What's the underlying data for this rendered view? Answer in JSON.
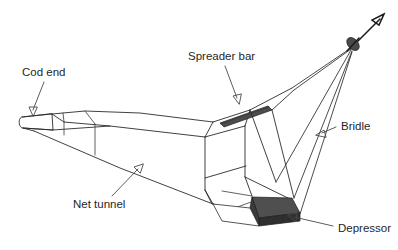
{
  "figure": {
    "type": "technical-line-diagram",
    "background_color": "#ffffff",
    "line_color": "#2b2b2b",
    "dark_fill_color": "#3f3f3f",
    "depressor_fill_color": "#4a4a4a",
    "spreader_fill_color": "#4d4d4d"
  },
  "labels": {
    "cod_end": "Cod end",
    "spreader_bar": "Spreader bar",
    "net_tunnel": "Net tunnel",
    "bridle": "Bridle",
    "depressor": "Depressor"
  },
  "parts": [
    {
      "id": "cod-end",
      "name": "Cod end",
      "description": "Rounded closed tube at the rear (left) end of the net"
    },
    {
      "id": "net-tunnel",
      "name": "Net tunnel",
      "description": "Long tapering panelled body joining cod end to net mouth"
    },
    {
      "id": "spreader-bar",
      "name": "Spreader bar",
      "description": "Dark rigid bar across the top of the net mouth"
    },
    {
      "id": "bridle",
      "name": "Bridle",
      "description": "Lines converging from the net mouth frame to the towing swivel"
    },
    {
      "id": "depressor",
      "name": "Depressor",
      "description": "Dark weighted plate at the bottom of the net mouth"
    },
    {
      "id": "towing-swivel",
      "name": "Towing swivel",
      "description": "Dark fitting where all bridle lines meet the tow warp"
    },
    {
      "id": "tow-direction",
      "name": "Tow direction arrow",
      "description": "Arrow leaving the swivel toward the upper right"
    }
  ],
  "annotations": [
    {
      "id": "cod-end",
      "label_key": "cod_end",
      "text_x": 22,
      "text_y": 73,
      "leader_from": [
        44,
        82
      ],
      "leader_to": [
        33,
        114
      ]
    },
    {
      "id": "spreader-bar",
      "label_key": "spreader_bar",
      "text_x": 188,
      "text_y": 57,
      "leader_from": [
        225,
        66
      ],
      "leader_to": [
        238,
        102
      ]
    },
    {
      "id": "net-tunnel",
      "label_key": "net_tunnel",
      "text_x": 73,
      "text_y": 205,
      "leader_from": [
        112,
        196
      ],
      "leader_to": [
        142,
        165
      ]
    },
    {
      "id": "bridle",
      "label_key": "bridle",
      "text_x": 341,
      "text_y": 127,
      "leader_from": [
        336,
        127
      ],
      "leader_to": [
        318,
        134
      ]
    },
    {
      "id": "depressor",
      "label_key": "depressor",
      "text_x": 338,
      "text_y": 229,
      "leader_from": [
        333,
        226
      ],
      "leader_to": [
        289,
        215
      ]
    }
  ]
}
